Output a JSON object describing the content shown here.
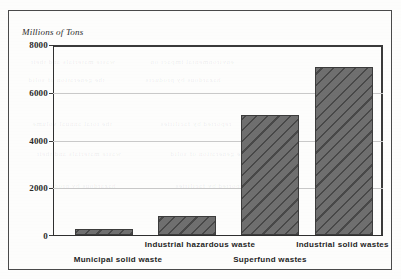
{
  "chart_data": {
    "type": "bar",
    "title": "",
    "subtitle": "",
    "xlabel": "",
    "ylabel": "Millions of Tons",
    "ylim": [
      0,
      8000
    ],
    "yticks": [
      0,
      2000,
      4000,
      6000,
      8000
    ],
    "ytick_labels": [
      "0",
      "2000",
      "4000",
      "6000",
      "8000"
    ],
    "grid": "horizontal",
    "legend": "none",
    "categories": [
      "Municipal solid waste",
      "Industrial hazardous waste",
      "Superfund wastes",
      "Industrial solid wastes"
    ],
    "values": [
      250,
      800,
      5050,
      7080
    ],
    "bar_fill": "#6f6f6f",
    "bar_pattern": "diagonal-hatch",
    "bar_outline": "#3c3c3c",
    "gridline_color": "#c9c9c9",
    "axis_color": "#2f2f2f",
    "label_stagger": [
      "lower",
      "upper",
      "lower",
      "upper"
    ]
  },
  "axis": {
    "y_title": "Millions of Tons",
    "ticks": [
      {
        "label": "8000",
        "value": 8000
      },
      {
        "label": "6000",
        "value": 6000
      },
      {
        "label": "4000",
        "value": 4000
      },
      {
        "label": "2000",
        "value": 2000
      },
      {
        "label": "0",
        "value": 0
      }
    ]
  },
  "bars": [
    {
      "label": "Municipal solid waste",
      "value": 250
    },
    {
      "label": "Industrial hazardous waste",
      "value": 800
    },
    {
      "label": "Superfund wastes",
      "value": 5050
    },
    {
      "label": "Industrial solid wastes",
      "value": 7080
    }
  ],
  "background_bleed": [
    "waste materials and their",
    "environmental impact on",
    "the generation of solid",
    "hazardous by products",
    "the total annual volume",
    "reported by facilities"
  ]
}
